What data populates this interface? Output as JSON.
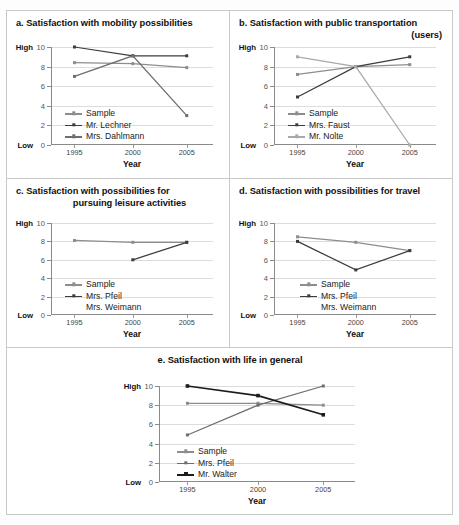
{
  "figure": {
    "axis": {
      "y_ticks": [
        "10",
        "8",
        "6",
        "4",
        "2",
        "0"
      ],
      "y_high_label": "High",
      "y_low_label": "Low",
      "x_ticks": [
        "1995",
        "2000",
        "2005"
      ],
      "x_title": "Year",
      "ylim": [
        0,
        10
      ]
    },
    "colors": {
      "sample": "#8d8d8d",
      "dark": "#3c3c3c",
      "darkest": "#1c1c1c",
      "light": "#a9a9a9",
      "grid": "#dcdcdc",
      "axis": "#8a8a8a",
      "panel_border": "#c9c9c9"
    },
    "panels": [
      {
        "id": "a",
        "title_line1": "a. Satisfaction with mobility possibilities",
        "title_line2": "",
        "legend": [
          {
            "label": "Sample",
            "marker": true
          },
          {
            "label": "Mr. Lechner",
            "marker": true
          },
          {
            "label": "Mrs. Dahlmann",
            "marker": true
          }
        ]
      },
      {
        "id": "b",
        "title_line1": "b. Satisfaction with public transportation",
        "title_line2": "(users)",
        "legend": [
          {
            "label": "Sample",
            "marker": true
          },
          {
            "label": "Mrs. Faust",
            "marker": true
          },
          {
            "label": "Mr. Nolte",
            "marker": true
          }
        ]
      },
      {
        "id": "c",
        "title_line1": "c. Satisfaction with possibilities for",
        "title_line2": "pursuing leisure activities",
        "legend": [
          {
            "label": "Sample",
            "marker": true
          },
          {
            "label": "Mrs. Pfeil",
            "marker": true
          },
          {
            "label": "Mrs. Weimann",
            "marker": false
          }
        ]
      },
      {
        "id": "d",
        "title_line1": "d. Satisfaction with possibilities for travel",
        "title_line2": "",
        "legend": [
          {
            "label": "Sample",
            "marker": true
          },
          {
            "label": "Mrs. Pfeil",
            "marker": true
          },
          {
            "label": "Mrs. Weimann",
            "marker": false
          }
        ]
      },
      {
        "id": "e",
        "title_line1": "e. Satisfaction with life in general",
        "title_line2": "",
        "legend": [
          {
            "label": "Sample",
            "marker": true
          },
          {
            "label": "Mrs. Pfeil",
            "marker": true
          },
          {
            "label": "Mr. Walter",
            "marker": true
          }
        ]
      }
    ]
  },
  "chart_data": [
    {
      "type": "line",
      "panel": "a",
      "title": "a. Satisfaction with mobility possibilities",
      "xlabel": "Year",
      "ylabel": "",
      "x": [
        1995,
        2000,
        2005
      ],
      "xtick_labels": [
        "1995",
        "2000",
        "2005"
      ],
      "ylim": [
        0,
        10
      ],
      "ytick_values": [
        0,
        2,
        4,
        6,
        8,
        10
      ],
      "y_axis_low_label": "Low",
      "y_axis_high_label": "High",
      "grid": true,
      "legend_position": "inside-lower-left",
      "series": [
        {
          "name": "Sample",
          "values": [
            8.4,
            8.3,
            7.9
          ],
          "color": "#8d8d8d"
        },
        {
          "name": "Mr. Lechner",
          "values": [
            10.0,
            9.1,
            9.1
          ],
          "color": "#3c3c3c"
        },
        {
          "name": "Mrs. Dahlmann",
          "values": [
            7.0,
            9.1,
            3.0
          ],
          "color": "#6e6e6e"
        }
      ]
    },
    {
      "type": "line",
      "panel": "b",
      "title": "b. Satisfaction with public transportation (users)",
      "xlabel": "Year",
      "ylabel": "",
      "x": [
        1995,
        2000,
        2005
      ],
      "xtick_labels": [
        "1995",
        "2000",
        "2005"
      ],
      "ylim": [
        0,
        10
      ],
      "ytick_values": [
        0,
        2,
        4,
        6,
        8,
        10
      ],
      "y_axis_low_label": "Low",
      "y_axis_high_label": "High",
      "grid": true,
      "legend_position": "inside-lower-left",
      "series": [
        {
          "name": "Sample",
          "values": [
            7.2,
            8.0,
            8.2
          ],
          "color": "#8d8d8d"
        },
        {
          "name": "Mrs. Faust",
          "values": [
            4.9,
            8.0,
            9.0
          ],
          "color": "#3c3c3c"
        },
        {
          "name": "Mr. Nolte",
          "values": [
            9.0,
            8.0,
            0.0
          ],
          "color": "#a9a9a9"
        }
      ]
    },
    {
      "type": "line",
      "panel": "c",
      "title": "c. Satisfaction with possibilities for pursuing leisure activities",
      "xlabel": "Year",
      "ylabel": "",
      "x": [
        1995,
        2000,
        2005
      ],
      "xtick_labels": [
        "1995",
        "2000",
        "2005"
      ],
      "ylim": [
        0,
        10
      ],
      "ytick_values": [
        0,
        2,
        4,
        6,
        8,
        10
      ],
      "y_axis_low_label": "Low",
      "y_axis_high_label": "High",
      "grid": true,
      "legend_position": "inside-lower-left",
      "series": [
        {
          "name": "Sample",
          "values": [
            8.1,
            7.9,
            7.9
          ],
          "color": "#8d8d8d"
        },
        {
          "name": "Mrs. Pfeil",
          "values": [
            null,
            6.0,
            7.9
          ],
          "color": "#3c3c3c"
        },
        {
          "name": "Mrs. Weimann",
          "values": [
            null,
            null,
            null
          ],
          "color": "#3c3c3c"
        }
      ]
    },
    {
      "type": "line",
      "panel": "d",
      "title": "d. Satisfaction with possibilities for travel",
      "xlabel": "Year",
      "ylabel": "",
      "x": [
        1995,
        2000,
        2005
      ],
      "xtick_labels": [
        "1995",
        "2000",
        "2005"
      ],
      "ylim": [
        0,
        10
      ],
      "ytick_values": [
        0,
        2,
        4,
        6,
        8,
        10
      ],
      "y_axis_low_label": "Low",
      "y_axis_high_label": "High",
      "grid": true,
      "legend_position": "inside-lower-right",
      "series": [
        {
          "name": "Sample",
          "values": [
            8.5,
            7.9,
            7.0
          ],
          "color": "#8d8d8d"
        },
        {
          "name": "Mrs. Pfeil",
          "values": [
            8.0,
            4.9,
            7.0
          ],
          "color": "#3c3c3c"
        },
        {
          "name": "Mrs. Weimann",
          "values": [
            null,
            null,
            null
          ],
          "color": "#3c3c3c"
        }
      ]
    },
    {
      "type": "line",
      "panel": "e",
      "title": "e. Satisfaction with life in general",
      "xlabel": "Year",
      "ylabel": "",
      "x": [
        1995,
        2000,
        2005
      ],
      "xtick_labels": [
        "1995",
        "2000",
        "2005"
      ],
      "ylim": [
        0,
        10
      ],
      "ytick_values": [
        0,
        2,
        4,
        6,
        8,
        10
      ],
      "y_axis_low_label": "Low",
      "y_axis_high_label": "High",
      "grid": true,
      "legend_position": "inside-lower-left",
      "series": [
        {
          "name": "Sample",
          "values": [
            8.2,
            8.2,
            8.0
          ],
          "color": "#8d8d8d"
        },
        {
          "name": "Mrs. Pfeil",
          "values": [
            4.9,
            8.0,
            10.0
          ],
          "color": "#6e6e6e"
        },
        {
          "name": "Mr. Walter",
          "values": [
            10.0,
            9.0,
            7.0
          ],
          "color": "#1c1c1c"
        }
      ]
    }
  ]
}
